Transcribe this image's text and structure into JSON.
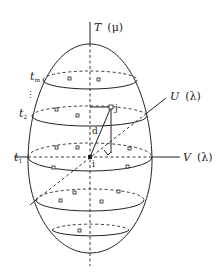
{
  "diagram": {
    "type": "ellipsoid space-time cube schematic",
    "axes": {
      "vertical": {
        "symbol": "T",
        "param": "(μ)",
        "label": "T (μ)"
      },
      "depth": {
        "symbol": "U",
        "param": "(λ)",
        "label": "U (λ)"
      },
      "horizontal": {
        "symbol": "V",
        "param": "(λ)",
        "label": "V (λ)"
      }
    },
    "time_slices": [
      {
        "label": "t",
        "sub": "m"
      },
      {
        "label": "⋮"
      },
      {
        "label": "t",
        "sub": "2"
      },
      {
        "label": "t",
        "sub": "1"
      }
    ],
    "points": {
      "i": "i",
      "j": "j",
      "distance": "d"
    },
    "colors": {
      "stroke": "#222222",
      "background": "#ffffff"
    }
  }
}
